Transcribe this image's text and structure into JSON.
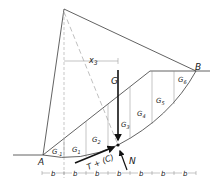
{
  "diagram": {
    "type": "slope-stability-slice-method",
    "points": {
      "A": "A",
      "B": "B"
    },
    "slices": [
      "G₋₁",
      "G₁",
      "G₂",
      "G₃",
      "G₄",
      "G₅",
      "G₆"
    ],
    "slice_labels": {
      "gm1": "G",
      "gm1_sub": "-1",
      "g1": "G",
      "g1_sub": "1",
      "g2": "G",
      "g2_sub": "2",
      "g3": "G",
      "g3_sub": "3",
      "g4": "G",
      "g4_sub": "4",
      "g5": "G",
      "g5_sub": "5",
      "g6": "G",
      "g6_sub": "6"
    },
    "forces": {
      "weight": "G",
      "shear": "T + (C)",
      "normal": "N"
    },
    "lever_arm": {
      "label": "x",
      "sub": "3"
    },
    "dimension": {
      "label": "b",
      "count": 7,
      "labels": [
        "b",
        "b",
        "b",
        "b",
        "b",
        "b",
        "b"
      ]
    },
    "colors": {
      "line": "#3a3a3a",
      "dashed": "#b0b0b0",
      "arrow": "#111111"
    }
  }
}
